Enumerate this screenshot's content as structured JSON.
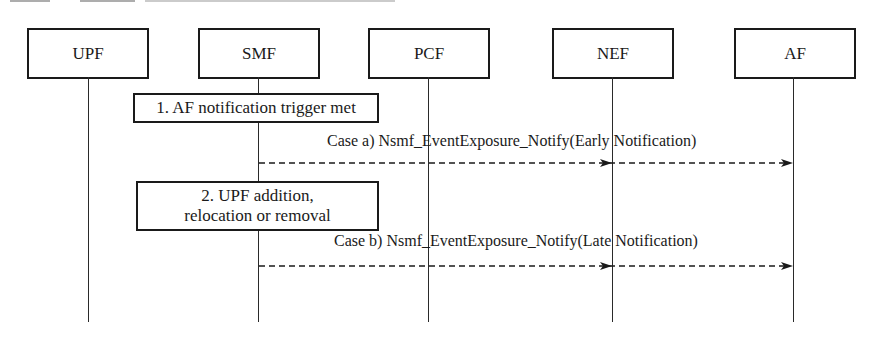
{
  "diagram": {
    "type": "sequence",
    "entities": [
      {
        "id": "upf",
        "label": "UPF"
      },
      {
        "id": "smf",
        "label": "SMF"
      },
      {
        "id": "pcf",
        "label": "PCF"
      },
      {
        "id": "nef",
        "label": "NEF"
      },
      {
        "id": "af",
        "label": "AF"
      }
    ],
    "steps": [
      {
        "label": "1. AF notification trigger met",
        "at": "SMF"
      },
      {
        "label": "2. UPF addition, relocation or removal",
        "at": "SMF"
      }
    ],
    "messages": [
      {
        "label": "Case a) Nsmf_EventExposure_Notify(Early Notification)",
        "from": "SMF",
        "to": [
          "NEF",
          "AF"
        ],
        "style": "dashed"
      },
      {
        "label": "Case b) Nsmf_EventExposure_Notify(Late Notification)",
        "from": "SMF",
        "to": [
          "NEF",
          "AF"
        ],
        "style": "dashed"
      }
    ]
  },
  "colors": {
    "line": "#1a1a1a",
    "background": "#ffffff"
  }
}
